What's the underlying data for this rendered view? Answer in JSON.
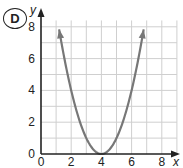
{
  "badge": {
    "label": "D"
  },
  "chart_data": {
    "type": "line",
    "title": "",
    "xlabel": "x",
    "ylabel": "y",
    "xlim": [
      0,
      8
    ],
    "ylim": [
      0,
      8
    ],
    "x_ticks": [
      0,
      2,
      4,
      6,
      8
    ],
    "y_ticks": [
      0,
      2,
      4,
      6,
      8
    ],
    "grid": true,
    "grid_step": 1,
    "series": [
      {
        "name": "parabola",
        "equation": "y = (x - 4)^2",
        "vertex": [
          4,
          0
        ],
        "x": [
          1.2,
          2,
          3,
          4,
          5,
          6,
          6.8
        ],
        "y": [
          7.84,
          4,
          1,
          0,
          1,
          4,
          7.84
        ],
        "arrows_at_ends": true,
        "color": "#777777"
      }
    ],
    "colors": {
      "axis": "#222222",
      "grid": "#cfcfcf",
      "curve": "#777777"
    }
  }
}
